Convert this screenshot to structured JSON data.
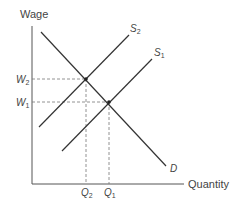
{
  "diagram": {
    "type": "supply-demand",
    "y_axis_label": "Wage",
    "x_axis_label": "Quantity",
    "curves": [
      {
        "id": "S2",
        "label": "S",
        "sub": "2",
        "kind": "supply"
      },
      {
        "id": "S1",
        "label": "S",
        "sub": "1",
        "kind": "supply"
      },
      {
        "id": "D",
        "label": "D",
        "kind": "demand"
      }
    ],
    "equilibria": [
      {
        "wage_label": "W",
        "wage_sub": "2",
        "qty_label": "Q",
        "qty_sub": "2"
      },
      {
        "wage_label": "W",
        "wage_sub": "1",
        "qty_label": "Q",
        "qty_sub": "1"
      }
    ],
    "colors": {
      "line": "#333333",
      "axis": "#555555",
      "dash": "#777777"
    }
  }
}
